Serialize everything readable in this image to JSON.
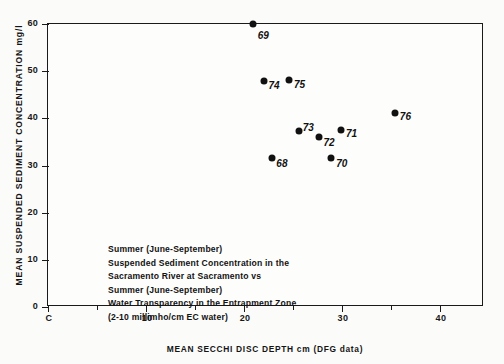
{
  "chart_data": {
    "type": "scatter",
    "title": "",
    "xlabel": "MEAN SECCHI DISC DEPTH cm (DFG data)",
    "ylabel": "MEAN SUSPENDED SEDIMENT CONCENTRATION mg/l",
    "xlim": [
      0,
      44.5
    ],
    "ylim": [
      0,
      60
    ],
    "grid": false,
    "legend": "none",
    "x_origin_label": "C",
    "xticks": [
      0,
      10,
      20,
      30,
      40
    ],
    "xtick_labels": [
      "C",
      "10",
      "20",
      "30",
      "40"
    ],
    "xticks_minor": [
      5,
      15,
      25,
      35
    ],
    "yticks": [
      0,
      10,
      20,
      30,
      40,
      50,
      60
    ],
    "ytick_labels": [
      "0",
      "10",
      "20",
      "30",
      "40",
      "50",
      "60"
    ],
    "points": [
      {
        "label": "69",
        "x": 20.9,
        "y": 60.0,
        "label_dx": 5,
        "label_dy": 11
      },
      {
        "label": "74",
        "x": 22.0,
        "y": 47.9,
        "label_dx": 5,
        "label_dy": 4
      },
      {
        "label": "75",
        "x": 24.6,
        "y": 48.1,
        "label_dx": 5,
        "label_dy": 4
      },
      {
        "label": "76",
        "x": 35.4,
        "y": 41.1,
        "label_dx": 5,
        "label_dy": 3
      },
      {
        "label": "73",
        "x": 25.6,
        "y": 37.3,
        "label_dx": 4,
        "label_dy": -4
      },
      {
        "label": "72",
        "x": 27.7,
        "y": 36.0,
        "label_dx": 4,
        "label_dy": 5
      },
      {
        "label": "71",
        "x": 29.9,
        "y": 37.5,
        "label_dx": 5,
        "label_dy": 3
      },
      {
        "label": "68",
        "x": 22.9,
        "y": 31.6,
        "label_dx": 4,
        "label_dy": 5
      },
      {
        "label": "70",
        "x": 28.9,
        "y": 31.6,
        "label_dx": 5,
        "label_dy": 5
      }
    ]
  },
  "caption": {
    "lines": [
      "Summer (June-September)",
      "Suspended Sediment Concentration in the",
      "Sacramento River at Sacramento vs",
      "Summer (June-September)",
      "Water Transparency in the Entrapment Zone",
      "(2-10 millimho/cm EC water)"
    ]
  }
}
